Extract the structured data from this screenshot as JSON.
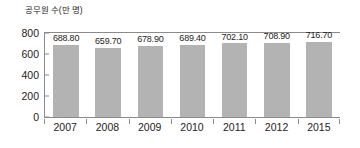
{
  "chart_data": {
    "type": "bar",
    "title": "공무원 수(만 명)",
    "xlabel": "",
    "ylabel": "공무원 수(만 명)",
    "categories": [
      "2007",
      "2008",
      "2009",
      "2010",
      "2011",
      "2012",
      "2015"
    ],
    "values": [
      688.8,
      659.7,
      678.9,
      689.4,
      702.1,
      708.9,
      716.7
    ],
    "value_labels": [
      "688.80",
      "659.70",
      "678.90",
      "689.40",
      "702.10",
      "708.90",
      "716.70"
    ],
    "ylim": [
      0,
      800
    ],
    "yticks": [
      0,
      200,
      400,
      600,
      800
    ],
    "ytick_labels": [
      "0",
      "200",
      "400",
      "600",
      "800"
    ],
    "grid": false,
    "legend": null,
    "series": [
      {
        "name": "공무원 수",
        "values": [
          688.8,
          659.7,
          678.9,
          689.4,
          702.1,
          708.9,
          716.7
        ]
      }
    ],
    "colors": {
      "bar_fill": "#b3b3b3",
      "axis_line": "#8b8b8b",
      "text": "#1e1c1a",
      "background": "#ffffff"
    }
  }
}
